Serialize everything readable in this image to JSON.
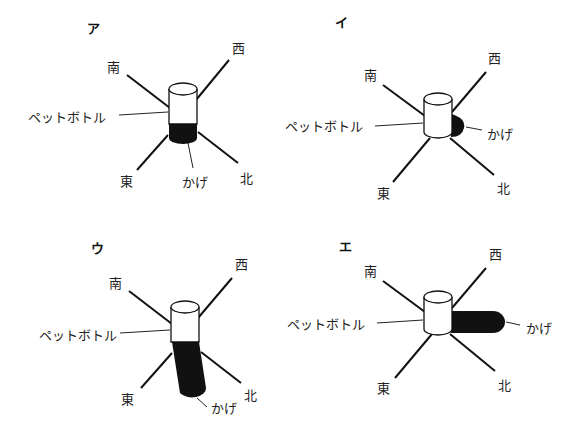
{
  "panels": [
    {
      "id": "a",
      "title": "ア",
      "labels": {
        "south": "南",
        "west": "西",
        "east": "東",
        "north": "北",
        "bottle": "ペットボトル",
        "shadow": "かげ"
      },
      "shadow_direction": "north-ish, short (below bottle)"
    },
    {
      "id": "i",
      "title": "イ",
      "labels": {
        "south": "南",
        "west": "西",
        "east": "東",
        "north": "北",
        "bottle": "ペットボトル",
        "shadow": "かげ"
      },
      "shadow_direction": "short, to the right"
    },
    {
      "id": "u",
      "title": "ウ",
      "labels": {
        "south": "南",
        "west": "西",
        "east": "東",
        "north": "北",
        "bottle": "ペットボトル",
        "shadow": "かげ"
      },
      "shadow_direction": "long, downward"
    },
    {
      "id": "e",
      "title": "エ",
      "labels": {
        "south": "南",
        "west": "西",
        "east": "東",
        "north": "北",
        "bottle": "ペットボトル",
        "shadow": "かげ"
      },
      "shadow_direction": "long, to the right"
    }
  ]
}
